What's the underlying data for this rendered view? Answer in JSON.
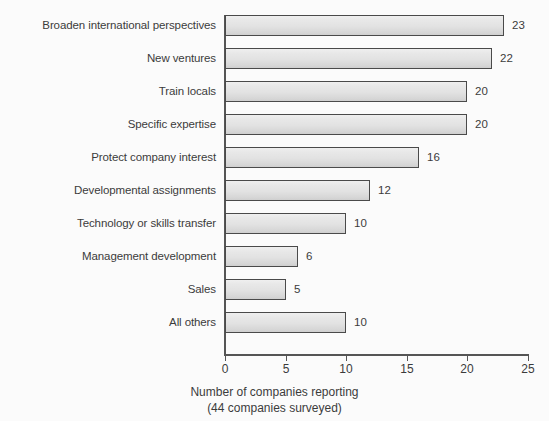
{
  "chart_data": {
    "type": "bar",
    "orientation": "horizontal",
    "title": "",
    "xlabel": "Number of companies reporting",
    "xlabel_sub": "(44 companies surveyed)",
    "ylabel": "",
    "xlim": [
      0,
      25
    ],
    "xticks": [
      0,
      5,
      10,
      15,
      20,
      25
    ],
    "xtick_labels": [
      "0",
      "5",
      "10",
      "15",
      "20",
      "25"
    ],
    "grid": false,
    "legend": false,
    "categories": [
      "Broaden international perspectives",
      "New ventures",
      "Train locals",
      "Specific expertise",
      "Protect company interest",
      "Developmental assignments",
      "Technology or skills transfer",
      "Management development",
      "Sales",
      "All others"
    ],
    "values": [
      23,
      22,
      20,
      20,
      16,
      12,
      10,
      6,
      5,
      10
    ],
    "value_labels": [
      "23",
      "22",
      "20",
      "20",
      "16",
      "12",
      "10",
      "6",
      "5",
      "10"
    ],
    "colors": {
      "bar_fill": "#e4e4e4",
      "bar_border": "#4a4a4a",
      "text": "#3b3b3b",
      "axis": "#555555",
      "background": "#fbfbfb",
      "shadow": "#8d8d8d"
    }
  }
}
